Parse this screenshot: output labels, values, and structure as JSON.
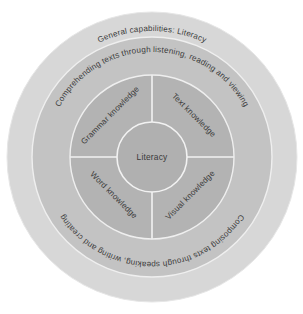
{
  "diagram": {
    "type": "concentric-circles",
    "title": "General capabilities: Literacy",
    "center": {
      "label": "Literacy"
    },
    "rings": [
      {
        "id": "outer",
        "name": "general-capabilities-ring",
        "label": "General capabilities: Literacy",
        "color": "#d6d6d6"
      },
      {
        "id": "comprehending",
        "name": "comprehending-ring",
        "label": "Comprehending texts through listening, reading and viewing",
        "color": "#c4c4c4"
      },
      {
        "id": "composing",
        "name": "composing-ring",
        "label": "Composing texts through speaking, writing and creating",
        "color": "#c4c4c4"
      }
    ],
    "quadrants": [
      {
        "id": "grammar",
        "label": "Grammar knowledge",
        "position": "top-left"
      },
      {
        "id": "text",
        "label": "Text knowledge",
        "position": "top-right"
      },
      {
        "id": "word",
        "label": "Word knowledge",
        "position": "bottom-left"
      },
      {
        "id": "visual",
        "label": "Visual knowledge",
        "position": "bottom-right"
      }
    ],
    "colors": {
      "background": "#ffffff",
      "outer_ring": "#d7d7d7",
      "middle_ring": "#c3c3c3",
      "quadrant_ring": "#b3b3b3",
      "core_circle": "#b0b0b0",
      "divider": "#f2f2f2",
      "text": "#3c3c3c"
    }
  }
}
